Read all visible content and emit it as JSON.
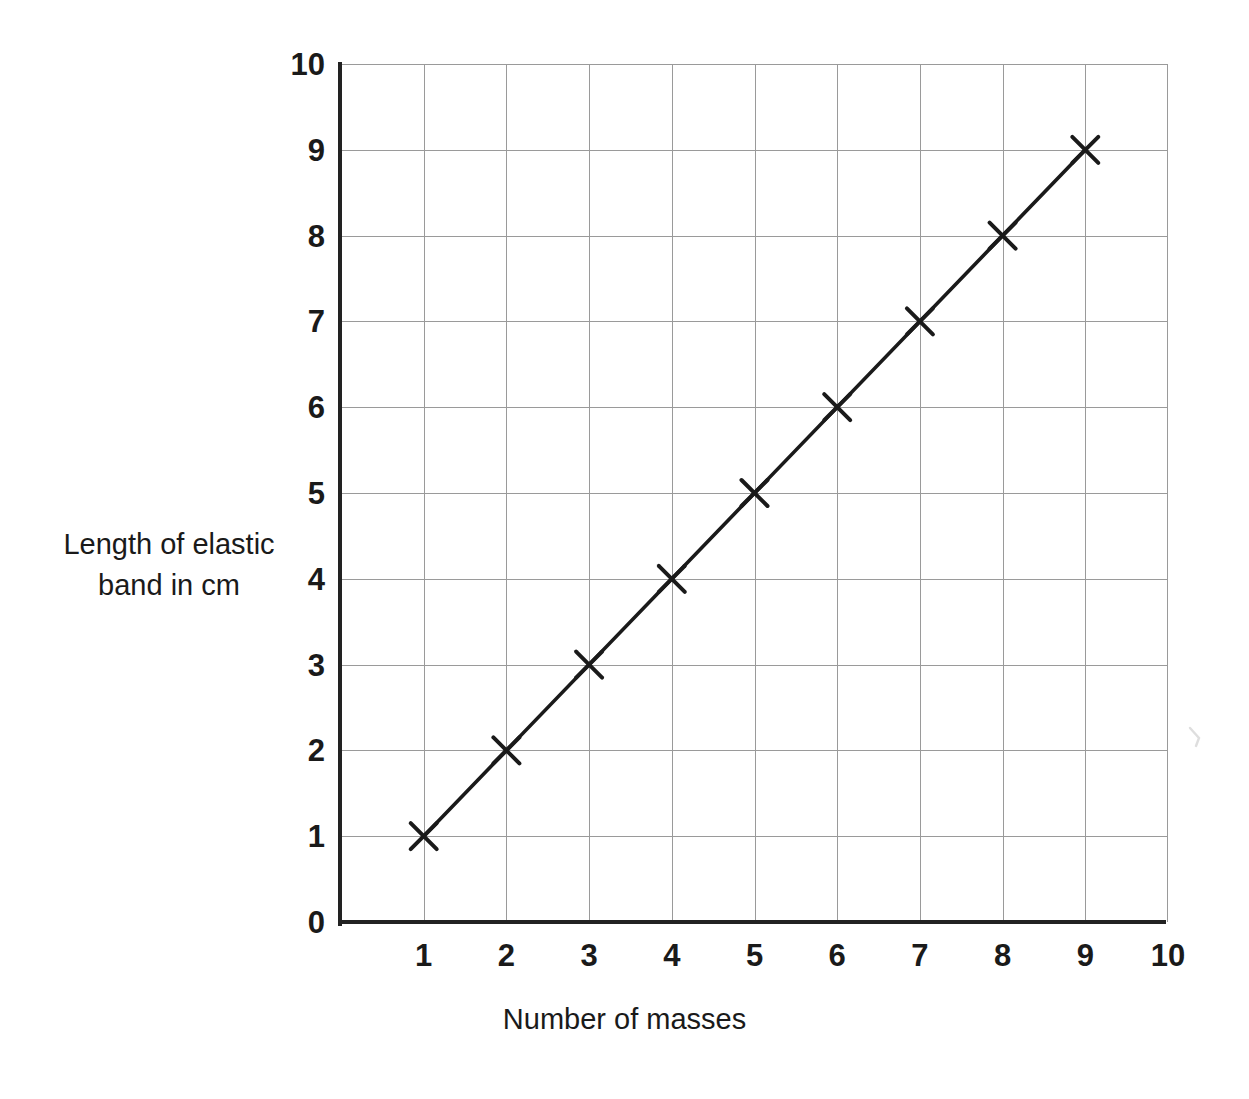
{
  "chart_data": {
    "type": "line",
    "title": "",
    "subtitle": "",
    "xlabel": "Number of masses",
    "ylabel_lines": [
      "Length of elastic",
      "band in cm"
    ],
    "ylabel": "Length of elastic band in cm",
    "x": [
      1,
      2,
      3,
      4,
      5,
      6,
      7,
      8,
      9
    ],
    "values": [
      1,
      2,
      3,
      4,
      5,
      6,
      7,
      8,
      9
    ],
    "series": [
      {
        "name": "Length of elastic band",
        "marker": "cross",
        "x": [
          1,
          2,
          3,
          4,
          5,
          6,
          7,
          8,
          9
        ],
        "values": [
          1,
          2,
          3,
          4,
          5,
          6,
          7,
          8,
          9
        ]
      }
    ],
    "xlim": [
      0,
      10
    ],
    "ylim": [
      0,
      10
    ],
    "x_ticks": [
      1,
      2,
      3,
      4,
      5,
      6,
      7,
      8,
      9,
      10
    ],
    "y_ticks": [
      0,
      1,
      2,
      3,
      4,
      5,
      6,
      7,
      8,
      9,
      10
    ],
    "x_tick_labels": [
      "1",
      "2",
      "3",
      "4",
      "5",
      "6",
      "7",
      "8",
      "9",
      "10"
    ],
    "y_tick_labels": [
      "0",
      "1",
      "2",
      "3",
      "4",
      "5",
      "6",
      "7",
      "8",
      "9",
      "10"
    ],
    "grid": true,
    "legend": false,
    "legend_position": "none",
    "trend_line": {
      "from": [
        1,
        1
      ],
      "to": [
        9,
        9
      ],
      "slope": 1,
      "intercept": 0
    },
    "colors": {
      "background": "#ffffff",
      "axis": "#222222",
      "grid": "#9a9a9a",
      "series": "#1a1a1a",
      "text": "#1a1a1a"
    }
  }
}
